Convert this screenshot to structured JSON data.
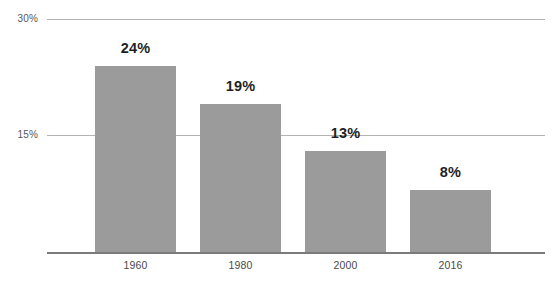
{
  "chart_data": {
    "type": "bar",
    "title": "",
    "subtitle": "",
    "xlabel": "",
    "ylabel": "",
    "categories": [
      "1960",
      "1980",
      "2000",
      "2016"
    ],
    "values": [
      24,
      19,
      13,
      8
    ],
    "data_labels": [
      "24%",
      "19%",
      "13%",
      "8%"
    ],
    "ylim": [
      0,
      30
    ],
    "yticks": [
      15,
      30
    ],
    "ytick_labels": [
      "15%",
      "30%"
    ],
    "grid": true,
    "grid_axis": "y",
    "legend": false,
    "legend_position": "none",
    "bar_color": "#9b9b9b",
    "gridline_color": "#b3b3b3",
    "axis_color": "#7a7a7a",
    "label_color": "#1f1f1f",
    "tick_color": "#4a4a4a",
    "background": "#ffffff"
  },
  "geometry": {
    "bars": [
      {
        "left": 95,
        "width": 81,
        "top": 62
      },
      {
        "left": 200,
        "width": 81,
        "top": 100
      },
      {
        "left": 305,
        "width": 81,
        "top": 149
      },
      {
        "left": 410,
        "width": 81,
        "top": 187
      }
    ],
    "value_labels": [
      {
        "left": 95,
        "width": 81,
        "top": 36
      },
      {
        "left": 200,
        "width": 81,
        "top": 74
      },
      {
        "left": 305,
        "width": 81,
        "top": 123
      },
      {
        "left": 410,
        "width": 81,
        "top": 161
      }
    ],
    "x_ticks": [
      {
        "left": 95,
        "width": 81
      },
      {
        "left": 200,
        "width": 81
      },
      {
        "left": 305,
        "width": 81
      },
      {
        "left": 410,
        "width": 81
      }
    ]
  }
}
